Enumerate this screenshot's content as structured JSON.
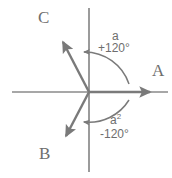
{
  "figure": {
    "background_color": "#ffffff",
    "stroke_color": "#7a7a7a",
    "text_color": "#6e6e6e",
    "origin": {
      "x": 89,
      "y": 92
    }
  },
  "axes": {
    "horizontal": {
      "x1": 12,
      "y1": 92,
      "x2": 168,
      "y2": 92
    },
    "vertical": {
      "x1": 89,
      "y1": 8,
      "x2": 89,
      "y2": 172
    }
  },
  "phasors": [
    {
      "name": "A",
      "label": "A",
      "angle_deg": 0,
      "tip": {
        "x": 157,
        "y": 92
      },
      "label_pos": {
        "x": 152,
        "y": 62
      }
    },
    {
      "name": "C",
      "label": "C",
      "angle_deg": 120,
      "tip": {
        "x": 59,
        "y": 37
      },
      "label_pos": {
        "x": 38,
        "y": 9
      }
    },
    {
      "name": "B",
      "label": "B",
      "angle_deg": -120,
      "tip": {
        "x": 62,
        "y": 141
      },
      "label_pos": {
        "x": 39,
        "y": 145
      }
    }
  ],
  "angle_arcs": [
    {
      "name": "arc-plus-120",
      "operator": "a",
      "operator_superscript": "",
      "angle_text": "+120°",
      "direction": "counterclockwise",
      "arrow_tip": {
        "x": 79,
        "y": 52
      }
    },
    {
      "name": "arc-minus-120",
      "operator": "a",
      "operator_superscript": "2",
      "angle_text": "-120°",
      "direction": "clockwise",
      "arrow_tip": {
        "x": 79,
        "y": 122
      }
    }
  ]
}
